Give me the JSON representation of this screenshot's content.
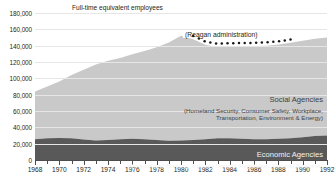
{
  "header": {
    "note": "Full-time equivalent employees"
  },
  "annotation": {
    "label": "(Reagan administration)"
  },
  "bands": {
    "social": {
      "title": "Social Agencies",
      "subtitle_line1": "(Homeland Security, Consumer Safety, Workplace,",
      "subtitle_line2": "Transportation, Environment & Energy)"
    },
    "economic": {
      "title": "Economic Agencies",
      "subtitle_line1": "(Finance and Banking, Industry-Specific Regulation, General Business)"
    }
  },
  "colors": {
    "social_fill": "#c9c9c9",
    "economic_fill": "#595959",
    "gridline": "#e6e6e6",
    "axis": "#4d4d4d",
    "text": "#231f20"
  },
  "chart_data": {
    "type": "area",
    "stacked": true,
    "title": "",
    "subtitle": "",
    "xlabel": "",
    "ylabel": "Full-time equivalent employees",
    "xlim": [
      1968,
      1992
    ],
    "ylim": [
      0,
      180000
    ],
    "grid": true,
    "legend": "inline-band-labels",
    "ytick_labels": [
      "0",
      "20,000",
      "40,000",
      "60,000",
      "80,000",
      "100,000",
      "120,000",
      "140,000",
      "160,000",
      "180,000"
    ],
    "ytick_values": [
      0,
      20000,
      40000,
      60000,
      80000,
      100000,
      120000,
      140000,
      160000,
      180000
    ],
    "xtick_labels": [
      "1968",
      "1970",
      "1972",
      "1974",
      "1976",
      "1978",
      "1980",
      "1982",
      "1984",
      "1986",
      "1988",
      "1990",
      "1992"
    ],
    "xtick_values": [
      1968,
      1970,
      1972,
      1974,
      1976,
      1978,
      1980,
      1982,
      1984,
      1986,
      1988,
      1990,
      1992
    ],
    "x": [
      1968,
      1969,
      1970,
      1971,
      1972,
      1973,
      1974,
      1975,
      1976,
      1977,
      1978,
      1979,
      1980,
      1981,
      1982,
      1983,
      1984,
      1985,
      1986,
      1987,
      1988,
      1989,
      1990,
      1991,
      1992
    ],
    "series": [
      {
        "name": "Economic Agencies",
        "values": [
          25500,
          26500,
          27000,
          26500,
          25000,
          24000,
          24500,
          25500,
          26000,
          25500,
          24500,
          23500,
          24000,
          24500,
          25500,
          26500,
          26500,
          26000,
          25500,
          25500,
          26000,
          26500,
          28000,
          29500,
          30000
        ]
      },
      {
        "name": "Social Agencies",
        "values": [
          58500,
          63500,
          69000,
          77500,
          85500,
          93000,
          97000,
          99500,
          103500,
          108000,
          113500,
          120500,
          128000,
          123500,
          115500,
          112000,
          112500,
          113500,
          114000,
          114500,
          115500,
          117000,
          118000,
          119000,
          120000
        ]
      }
    ],
    "totals": [
      84000,
      90000,
      96000,
      104000,
      110500,
      117000,
      121500,
      125000,
      129500,
      133500,
      138000,
      144000,
      152000,
      148000,
      141000,
      138500,
      139000,
      139500,
      139500,
      140000,
      141500,
      143500,
      146000,
      148500,
      150000
    ],
    "annotations": [
      {
        "text": "(Reagan administration)",
        "x_range": [
          1981,
          1989
        ],
        "style": "dotted-curve"
      }
    ]
  }
}
